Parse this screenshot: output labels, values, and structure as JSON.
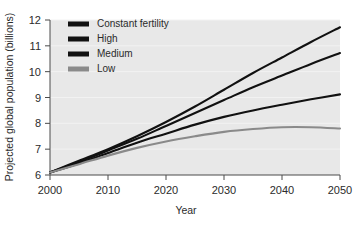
{
  "chart_data": {
    "type": "line",
    "title": "",
    "xlabel": "Year",
    "ylabel": "Projected global population (billions)",
    "xlim": [
      2000,
      2050
    ],
    "ylim": [
      6,
      12
    ],
    "xticks": [
      "2000",
      "2010",
      "2020",
      "2030",
      "2040",
      "2050"
    ],
    "yticks": [
      "6",
      "7",
      "8",
      "9",
      "10",
      "11",
      "12"
    ],
    "grid": "horizontal",
    "legend_position": "top-left",
    "x": [
      2000,
      2005,
      2010,
      2015,
      2020,
      2025,
      2030,
      2035,
      2040,
      2045,
      2050
    ],
    "series": [
      {
        "name": "Constant fertility",
        "color": "#111111",
        "values": [
          6.1,
          6.55,
          7.0,
          7.5,
          8.05,
          8.65,
          9.3,
          9.95,
          10.55,
          11.15,
          11.72
        ]
      },
      {
        "name": "High",
        "color": "#111111",
        "values": [
          6.1,
          6.5,
          6.95,
          7.4,
          7.9,
          8.4,
          8.9,
          9.4,
          9.85,
          10.3,
          10.72
        ]
      },
      {
        "name": "Medium",
        "color": "#111111",
        "values": [
          6.1,
          6.45,
          6.85,
          7.25,
          7.6,
          7.95,
          8.25,
          8.5,
          8.72,
          8.93,
          9.12
        ]
      },
      {
        "name": "Low",
        "color": "#8a8a8a",
        "values": [
          6.1,
          6.42,
          6.75,
          7.05,
          7.3,
          7.5,
          7.67,
          7.78,
          7.85,
          7.85,
          7.8
        ]
      }
    ]
  },
  "legend": {
    "items": [
      {
        "label": "Constant fertility",
        "color": "#111111"
      },
      {
        "label": "High",
        "color": "#111111"
      },
      {
        "label": "Medium",
        "color": "#111111"
      },
      {
        "label": "Low",
        "color": "#8a8a8a"
      }
    ]
  }
}
